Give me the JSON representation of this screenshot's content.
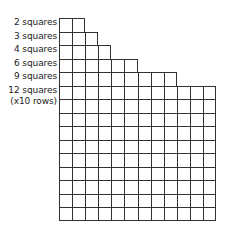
{
  "diagram": {
    "labels": [
      {
        "text": "2 squares",
        "count": 2
      },
      {
        "text": "3 squares",
        "count": 3
      },
      {
        "text": "4 squares",
        "count": 4
      },
      {
        "text": "6 squares",
        "count": 6
      },
      {
        "text": "9 squares",
        "count": 9
      },
      {
        "text": "12 squares",
        "count": 12
      }
    ],
    "last_label_note": "(x10 rows)",
    "repeat_rows": 10,
    "line_color": "#333333"
  }
}
